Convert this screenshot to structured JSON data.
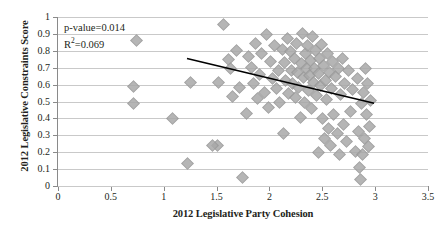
{
  "chart_data": {
    "type": "scatter",
    "title": "",
    "xlabel": "2012 Legislative Party Cohesion",
    "ylabel": "2012 Legislative Constraints Score",
    "xlim": [
      0,
      3.5
    ],
    "ylim": [
      0,
      1
    ],
    "grid": true,
    "legend": false,
    "xticks": [
      "0",
      "0.5",
      "1",
      "1.5",
      "2",
      "2.5",
      "3",
      "3.5"
    ],
    "xtick_values": [
      0,
      0.5,
      1,
      1.5,
      2,
      2.5,
      3,
      3.5
    ],
    "yticks": [
      "0",
      "0.1",
      "0.2",
      "0.3",
      "0.4",
      "0.5",
      "0.6",
      "0.7",
      "0.8",
      "0.9",
      "1"
    ],
    "ytick_values": [
      0,
      0.1,
      0.2,
      0.3,
      0.4,
      0.5,
      0.6,
      0.7,
      0.8,
      0.9,
      1
    ],
    "annotations": {
      "p_value": "p-value=0.014",
      "r_squared_prefix": "R",
      "r_squared_exponent": "2",
      "r_squared_value": "=0.069"
    },
    "marker_color": "#a9a9a9",
    "trendline_color": "#000000",
    "gridline_color": "#c9c9c9",
    "trendline": {
      "x_start": 1.22,
      "y_start": 0.755,
      "x_end": 2.99,
      "y_end": 0.49
    },
    "points": [
      [
        0.7,
        0.595
      ],
      [
        0.7,
        0.497
      ],
      [
        0.73,
        0.866
      ],
      [
        1.07,
        0.405
      ],
      [
        1.22,
        0.138
      ],
      [
        1.24,
        0.617
      ],
      [
        1.5,
        0.247
      ],
      [
        1.51,
        0.617
      ],
      [
        1.56,
        0.96
      ],
      [
        1.6,
        0.756
      ],
      [
        1.62,
        0.702
      ],
      [
        1.64,
        0.537
      ],
      [
        1.68,
        0.81
      ],
      [
        1.71,
        0.59
      ],
      [
        1.74,
        0.055
      ],
      [
        1.77,
        0.436
      ],
      [
        1.79,
        0.775
      ],
      [
        1.82,
        0.707
      ],
      [
        1.84,
        0.615
      ],
      [
        1.86,
        0.848
      ],
      [
        1.88,
        0.522
      ],
      [
        1.9,
        0.666
      ],
      [
        1.92,
        0.79
      ],
      [
        1.94,
        0.562
      ],
      [
        1.96,
        0.905
      ],
      [
        1.98,
        0.47
      ],
      [
        2.0,
        0.742
      ],
      [
        2.02,
        0.64
      ],
      [
        2.04,
        0.838
      ],
      [
        2.06,
        0.585
      ],
      [
        2.08,
        0.69
      ],
      [
        2.09,
        0.498
      ],
      [
        2.11,
        0.812
      ],
      [
        2.13,
        0.735
      ],
      [
        2.14,
        0.628
      ],
      [
        2.16,
        0.878
      ],
      [
        2.17,
        0.552
      ],
      [
        2.19,
        0.8
      ],
      [
        2.2,
        0.69
      ],
      [
        2.21,
        0.612
      ],
      [
        2.23,
        0.762
      ],
      [
        2.24,
        0.528
      ],
      [
        2.25,
        0.848
      ],
      [
        2.26,
        0.676
      ],
      [
        2.27,
        0.59
      ],
      [
        2.29,
        0.73
      ],
      [
        2.3,
        0.908
      ],
      [
        2.31,
        0.645
      ],
      [
        2.32,
        0.5
      ],
      [
        2.33,
        0.788
      ],
      [
        2.34,
        0.702
      ],
      [
        2.35,
        0.84
      ],
      [
        2.36,
        0.572
      ],
      [
        2.37,
        0.658
      ],
      [
        2.38,
        0.748
      ],
      [
        2.39,
        0.462
      ],
      [
        2.4,
        0.888
      ],
      [
        2.41,
        0.62
      ],
      [
        2.42,
        0.7
      ],
      [
        2.43,
        0.805
      ],
      [
        2.44,
        0.54
      ],
      [
        2.45,
        0.672
      ],
      [
        2.46,
        0.76
      ],
      [
        2.47,
        0.6
      ],
      [
        2.48,
        0.845
      ],
      [
        2.49,
        0.405
      ],
      [
        2.5,
        0.718
      ],
      [
        2.51,
        0.285
      ],
      [
        2.52,
        0.63
      ],
      [
        2.53,
        0.52
      ],
      [
        2.54,
        0.79
      ],
      [
        2.55,
        0.345
      ],
      [
        2.56,
        0.678
      ],
      [
        2.57,
        0.245
      ],
      [
        2.58,
        0.58
      ],
      [
        2.59,
        0.742
      ],
      [
        2.6,
        0.43
      ],
      [
        2.62,
        0.655
      ],
      [
        2.63,
        0.318
      ],
      [
        2.64,
        0.7
      ],
      [
        2.65,
        0.192
      ],
      [
        2.66,
        0.545
      ],
      [
        2.68,
        0.76
      ],
      [
        2.69,
        0.372
      ],
      [
        2.7,
        0.615
      ],
      [
        2.72,
        0.268
      ],
      [
        2.74,
        0.69
      ],
      [
        2.76,
        0.448
      ],
      [
        2.78,
        0.575
      ],
      [
        2.8,
        0.21
      ],
      [
        2.82,
        0.64
      ],
      [
        2.83,
        0.33
      ],
      [
        2.84,
        0.118
      ],
      [
        2.85,
        0.042
      ],
      [
        2.86,
        0.492
      ],
      [
        2.87,
        0.195
      ],
      [
        2.88,
        0.56
      ],
      [
        2.89,
        0.285
      ],
      [
        2.9,
        0.7
      ],
      [
        2.91,
        0.43
      ],
      [
        2.92,
        0.612
      ],
      [
        2.93,
        0.24
      ],
      [
        2.94,
        0.358
      ],
      [
        2.95,
        0.51
      ],
      [
        1.45,
        0.247
      ],
      [
        2.12,
        0.318
      ],
      [
        2.28,
        0.412
      ],
      [
        2.45,
        0.205
      ]
    ]
  }
}
